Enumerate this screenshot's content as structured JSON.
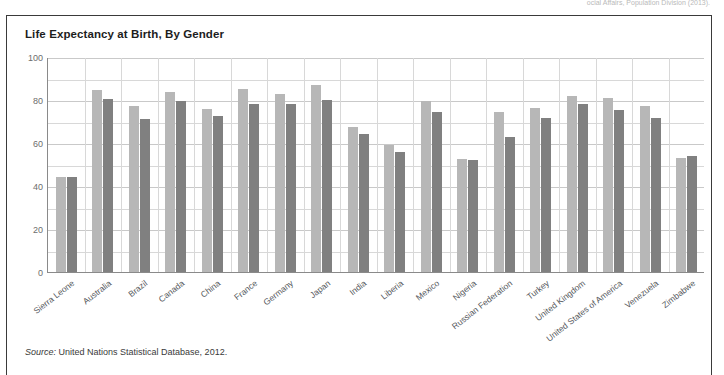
{
  "top_caption": "ocial Affairs, Population Division (2013).",
  "figure": {
    "title": "Life Expectancy at Birth, By Gender",
    "source_label": "Source:",
    "source_text": "United Nations Statistical Database, 2012."
  },
  "colors": {
    "female_bar": "#b7b7b7",
    "male_bar": "#808080",
    "frame": "#3a3a3a",
    "axis": "#8a8a8a",
    "grid": "#d8d8d8"
  },
  "chart_data": {
    "type": "bar",
    "title": "Life Expectancy at Birth, By Gender",
    "xlabel": "",
    "ylabel": "",
    "ylim": [
      0,
      100
    ],
    "ytick_labels": [
      "0",
      "20",
      "40",
      "60",
      "80",
      "100"
    ],
    "yticks": [
      0,
      20,
      40,
      60,
      80,
      100
    ],
    "yminor_step": 10,
    "grid": true,
    "legend": null,
    "categories": [
      "Sierra Leone",
      "Australia",
      "Brazil",
      "Canada",
      "China",
      "France",
      "Germany",
      "Japan",
      "India",
      "Liberia",
      "Mexico",
      "Nigeria",
      "Russian Federation",
      "Turkey",
      "United Kingdom",
      "United States of America",
      "Venezuela",
      "Zimbabwe"
    ],
    "series": [
      {
        "name": "Female",
        "color": "#b7b7b7",
        "values": [
          44,
          84.5,
          77,
          83.5,
          76,
          85,
          83,
          87,
          67.5,
          59,
          79.5,
          52.5,
          74.5,
          76.5,
          82,
          81,
          77,
          53
        ]
      },
      {
        "name": "Male",
        "color": "#808080",
        "values": [
          44,
          80.5,
          71,
          79.5,
          72.5,
          78,
          78,
          80,
          64,
          56,
          74.5,
          52,
          63,
          71.5,
          78,
          75.5,
          71.5,
          54
        ]
      }
    ]
  }
}
